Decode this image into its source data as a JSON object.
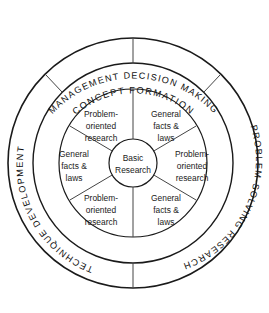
{
  "diagram": {
    "background_color": "#ffffff",
    "stroke_color": "#1a1a1a",
    "center": {
      "label_line1": "Basic",
      "label_line2": "Research"
    },
    "outer_ring_labels": [
      {
        "id": "top",
        "text": "MANAGEMENT DECISION MAKING"
      },
      {
        "id": "right",
        "text": "PROBLEM-SOLVING RESEARCH"
      },
      {
        "id": "left",
        "text": "TECHNIQUE DEVELOPMENT"
      }
    ],
    "middle_ring_labels": [
      {
        "id": "top",
        "text": "CONCEPT FORMATION"
      }
    ],
    "segments": [
      {
        "id": "upper-left",
        "line1": "Problem-",
        "line2": "oriented",
        "line3": "research"
      },
      {
        "id": "upper-right",
        "line1": "General",
        "line2": "facts &",
        "line3": "laws"
      },
      {
        "id": "right",
        "line1": "Problem-",
        "line2": "oriented",
        "line3": "research"
      },
      {
        "id": "lower-right",
        "line1": "General",
        "line2": "facts &",
        "line3": "laws"
      },
      {
        "id": "lower-left",
        "line1": "Problem-",
        "line2": "oriented",
        "line3": "research"
      },
      {
        "id": "left",
        "line1": "General",
        "line2": "facts &",
        "line3": "laws"
      }
    ]
  }
}
